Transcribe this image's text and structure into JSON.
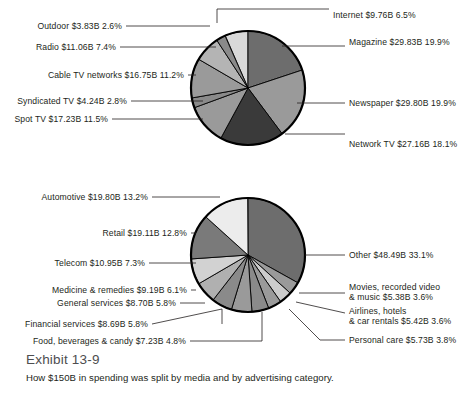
{
  "exhibit": {
    "title": "Exhibit 13-9",
    "subtitle": "How $150B in spending was split by media and by advertising category."
  },
  "chart_data": [
    {
      "type": "pie",
      "title": "Advertising spending by media",
      "total": "$150B",
      "units": "USD billions",
      "legend": "callout labels with leader lines",
      "grid": false,
      "labels": [
        "Internet $9.76B 6.5%",
        "Magazine $29.83B 19.9%",
        "Newspaper $29.80B 19.9%",
        "Network TV $27.16B 18.1%",
        "Spot TV $17.23B 11.5%",
        "Syndicated TV $4.24B 2.8%",
        "Cable TV networks $16.75B 11.2%",
        "Radio $11.06B 7.4%",
        "Outdoor $3.83B 2.6%"
      ],
      "categories": [
        "Internet",
        "Magazine",
        "Newspaper",
        "Network TV",
        "Spot TV",
        "Syndicated TV",
        "Cable TV networks",
        "Radio",
        "Outdoor"
      ],
      "values": [
        9.76,
        29.83,
        29.8,
        27.16,
        17.23,
        4.24,
        16.75,
        11.06,
        3.83
      ],
      "percents": [
        6.5,
        19.9,
        19.9,
        18.1,
        11.5,
        2.8,
        11.2,
        7.4,
        2.6
      ],
      "colors": [
        "#d9d9d9",
        "#6d6d6d",
        "#9a9a9a",
        "#3a3a3a",
        "#9a9a9a",
        "#8a8a8a",
        "#9a9a9a",
        "#b4b4b4",
        "#8a8a8a"
      ]
    },
    {
      "type": "pie",
      "title": "Advertising spending by category",
      "total": "$150B",
      "units": "USD billions",
      "legend": "callout labels with leader lines",
      "grid": false,
      "labels": [
        "Other $48.49B 33.1%",
        "Movies, recorded video & music $5.38B 3.6%",
        "Airlines, hotels & car rentals $5.42B 3.6%",
        "Personal care $5.73B 3.8%",
        "Food, beverages & candy $7.23B 4.8%",
        "Financial services $8.69B 5.8%",
        "General services $8.70B 5.8%",
        "Medicine & remedies $9.19B 6.1%",
        "Telecom $10.95B 7.3%",
        "Retail $19.11B 12.8%",
        "Automotive $19.80B 13.2%"
      ],
      "categories": [
        "Other",
        "Movies, recorded video & music",
        "Airlines, hotels & car rentals",
        "Personal care",
        "Food, beverages & candy",
        "Financial services",
        "General services",
        "Medicine & remedies",
        "Telecom",
        "Retail",
        "Automotive"
      ],
      "values": [
        48.49,
        5.38,
        5.42,
        5.73,
        7.23,
        8.69,
        8.7,
        9.19,
        10.95,
        19.11,
        19.8
      ],
      "percents": [
        33.1,
        3.6,
        3.6,
        3.8,
        4.8,
        5.8,
        5.8,
        6.1,
        7.3,
        12.8,
        13.2
      ],
      "colors": [
        "#6d6d6d",
        "#9a9a9a",
        "#cccccc",
        "#9a9a9a",
        "#8a8a8a",
        "#9a9a9a",
        "#8a8a8a",
        "#b0b0b0",
        "#d2d2d2",
        "#7a7a7a",
        "#ececec"
      ]
    }
  ],
  "media_chart": {
    "slices": [
      {
        "name": "internet",
        "label": "Internet $9.76B 6.5%",
        "pct": 6.5,
        "color": "#d9d9d9"
      },
      {
        "name": "magazine",
        "label": "Magazine $29.83B 19.9%",
        "pct": 19.9,
        "color": "#6d6d6d"
      },
      {
        "name": "newspaper",
        "label": "Newspaper $29.80B 19.9%",
        "pct": 19.9,
        "color": "#9a9a9a"
      },
      {
        "name": "network-tv",
        "label": "Network TV $27.16B 18.1%",
        "pct": 18.1,
        "color": "#3a3a3a"
      },
      {
        "name": "spot-tv",
        "label": "Spot TV $17.23B 11.5%",
        "pct": 11.5,
        "color": "#9a9a9a"
      },
      {
        "name": "syndicated-tv",
        "label": "Syndicated TV $4.24B 2.8%",
        "pct": 2.8,
        "color": "#8a8a8a"
      },
      {
        "name": "cable-tv-networks",
        "label": "Cable TV networks $16.75B 11.2%",
        "pct": 11.2,
        "color": "#9a9a9a"
      },
      {
        "name": "radio",
        "label": "Radio $11.06B 7.4%",
        "pct": 7.4,
        "color": "#b4b4b4"
      },
      {
        "name": "outdoor",
        "label": "Outdoor $3.83B 2.6%",
        "pct": 2.6,
        "color": "#8a8a8a"
      }
    ]
  },
  "category_chart": {
    "slices": [
      {
        "name": "other",
        "label": "Other $48.49B 33.1%",
        "pct": 33.1,
        "color": "#6d6d6d"
      },
      {
        "name": "movies-video-music-a",
        "label": "Movies, recorded video",
        "pct": 3.6,
        "color": "#9a9a9a"
      },
      {
        "name": "airlines-hotels-cars",
        "label": "Airlines, hotels",
        "pct": 3.6,
        "color": "#cccccc"
      },
      {
        "name": "personal-care",
        "label": "Personal care $5.73B 3.8%",
        "pct": 3.8,
        "color": "#9a9a9a"
      },
      {
        "name": "food-beverages-candy",
        "label": "Food, beverages & candy $7.23B 4.8%",
        "pct": 4.8,
        "color": "#8a8a8a"
      },
      {
        "name": "financial-services",
        "label": "Financial services $8.69B 5.8%",
        "pct": 5.8,
        "color": "#9a9a9a"
      },
      {
        "name": "general-services",
        "label": "General services $8.70B 5.8%",
        "pct": 5.8,
        "color": "#8a8a8a"
      },
      {
        "name": "medicine-remedies",
        "label": "Medicine & remedies $9.19B 6.1%",
        "pct": 6.1,
        "color": "#b0b0b0"
      },
      {
        "name": "telecom",
        "label": "Telecom $10.95B 7.3%",
        "pct": 7.3,
        "color": "#d2d2d2"
      },
      {
        "name": "retail",
        "label": "Retail $19.11B 12.8%",
        "pct": 12.8,
        "color": "#7a7a7a"
      },
      {
        "name": "automotive",
        "label": "Automotive $19.80B 13.2%",
        "pct": 13.2,
        "color": "#ececec"
      }
    ],
    "multiline": {
      "movies_line1": "Movies, recorded video",
      "movies_line2": "& music $5.38B 3.6%",
      "airlines_line1": "Airlines, hotels",
      "airlines_line2": "& car rentals $5.42B 3.6%"
    }
  }
}
